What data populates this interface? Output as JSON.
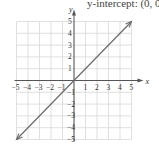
{
  "header": {
    "text": "y-intercept: (0, 0)"
  },
  "chart_data": {
    "type": "line",
    "title": "",
    "xlabel": "x",
    "ylabel": "y",
    "xlim": [
      -5,
      5
    ],
    "ylim": [
      -5,
      5
    ],
    "grid": true,
    "x_ticks": [
      "-5",
      "-4",
      "-3",
      "-2",
      "-1",
      "1",
      "2",
      "3",
      "4",
      "5"
    ],
    "y_ticks": [
      "5",
      "4",
      "3",
      "2",
      "1",
      "-1",
      "-2",
      "-3",
      "-4",
      "-5"
    ],
    "series": [
      {
        "name": "y = x",
        "x": [
          -5,
          5
        ],
        "y": [
          -5,
          5
        ],
        "arrows": "both",
        "color": "#666666"
      }
    ]
  },
  "colors": {
    "grid": "#d8d8d8",
    "axis": "#555555",
    "line": "#6b6b6b"
  }
}
